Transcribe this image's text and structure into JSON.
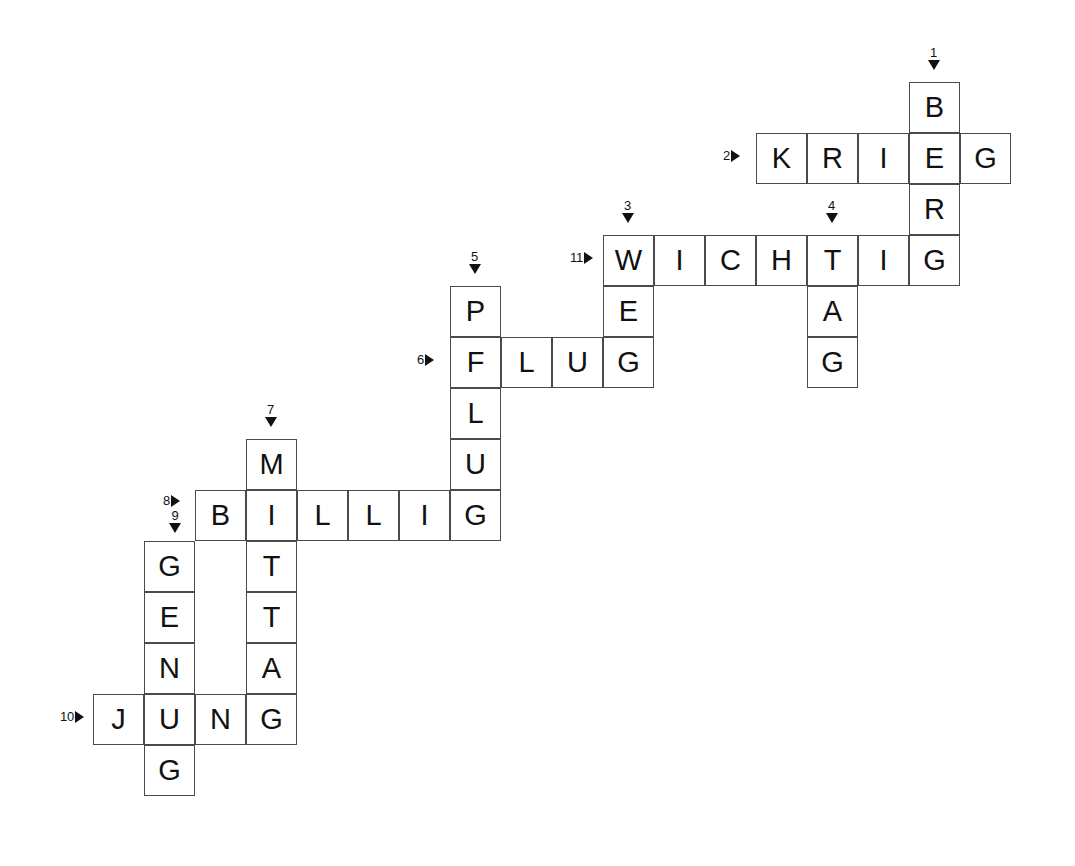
{
  "puzzle": {
    "type": "crossword",
    "language": "German",
    "title": "",
    "grid": {
      "origin_x": 93,
      "origin_y": 82,
      "cell_size": 51,
      "columns": 18,
      "rows": 14
    },
    "entries": [
      {
        "number": "1",
        "direction": "down",
        "answer": "BERG",
        "start_col": 16,
        "start_row": 0
      },
      {
        "number": "2",
        "direction": "across",
        "answer": "KRIEG",
        "start_col": 13,
        "start_row": 1
      },
      {
        "number": "3",
        "direction": "down",
        "answer": "WEG",
        "start_col": 10,
        "start_row": 3
      },
      {
        "number": "4",
        "direction": "down",
        "answer": "TAG",
        "start_col": 14,
        "start_row": 3
      },
      {
        "number": "5",
        "direction": "down",
        "answer": "PFLUG",
        "start_col": 7,
        "start_row": 4
      },
      {
        "number": "6",
        "direction": "across",
        "answer": "FLUG",
        "start_col": 7,
        "start_row": 5
      },
      {
        "number": "7",
        "direction": "down",
        "answer": "MITTAG",
        "start_col": 3,
        "start_row": 7
      },
      {
        "number": "8",
        "direction": "across",
        "answer": "BILLIG",
        "start_col": 2,
        "start_row": 8
      },
      {
        "number": "9",
        "direction": "down",
        "answer": "GENUG",
        "start_col": 1,
        "start_row": 9
      },
      {
        "number": "10",
        "direction": "across",
        "answer": "JUNG",
        "start_col": 0,
        "start_row": 12
      },
      {
        "number": "11",
        "direction": "across",
        "answer": "WICHTIG",
        "start_col": 10,
        "start_row": 3
      }
    ],
    "cells": [
      {
        "letter": "B",
        "col": 16,
        "row": 0
      },
      {
        "letter": "K",
        "col": 13,
        "row": 1
      },
      {
        "letter": "R",
        "col": 14,
        "row": 1
      },
      {
        "letter": "I",
        "col": 15,
        "row": 1
      },
      {
        "letter": "E",
        "col": 16,
        "row": 1
      },
      {
        "letter": "G",
        "col": 17,
        "row": 1
      },
      {
        "letter": "R",
        "col": 16,
        "row": 2
      },
      {
        "letter": "W",
        "col": 10,
        "row": 3
      },
      {
        "letter": "I",
        "col": 11,
        "row": 3
      },
      {
        "letter": "C",
        "col": 12,
        "row": 3
      },
      {
        "letter": "H",
        "col": 13,
        "row": 3
      },
      {
        "letter": "T",
        "col": 14,
        "row": 3
      },
      {
        "letter": "I",
        "col": 15,
        "row": 3
      },
      {
        "letter": "G",
        "col": 16,
        "row": 3
      },
      {
        "letter": "P",
        "col": 7,
        "row": 4
      },
      {
        "letter": "E",
        "col": 10,
        "row": 4
      },
      {
        "letter": "A",
        "col": 14,
        "row": 4
      },
      {
        "letter": "F",
        "col": 7,
        "row": 5
      },
      {
        "letter": "L",
        "col": 8,
        "row": 5
      },
      {
        "letter": "U",
        "col": 9,
        "row": 5
      },
      {
        "letter": "G",
        "col": 10,
        "row": 5
      },
      {
        "letter": "G",
        "col": 14,
        "row": 5
      },
      {
        "letter": "L",
        "col": 7,
        "row": 6
      },
      {
        "letter": "M",
        "col": 3,
        "row": 7
      },
      {
        "letter": "U",
        "col": 7,
        "row": 7
      },
      {
        "letter": "B",
        "col": 2,
        "row": 8
      },
      {
        "letter": "I",
        "col": 3,
        "row": 8
      },
      {
        "letter": "L",
        "col": 4,
        "row": 8
      },
      {
        "letter": "L",
        "col": 5,
        "row": 8
      },
      {
        "letter": "I",
        "col": 6,
        "row": 8
      },
      {
        "letter": "G",
        "col": 7,
        "row": 8
      },
      {
        "letter": "G",
        "col": 1,
        "row": 9
      },
      {
        "letter": "T",
        "col": 3,
        "row": 9
      },
      {
        "letter": "E",
        "col": 1,
        "row": 10
      },
      {
        "letter": "T",
        "col": 3,
        "row": 10
      },
      {
        "letter": "N",
        "col": 1,
        "row": 11
      },
      {
        "letter": "A",
        "col": 3,
        "row": 11
      },
      {
        "letter": "J",
        "col": 0,
        "row": 12
      },
      {
        "letter": "U",
        "col": 1,
        "row": 12
      },
      {
        "letter": "N",
        "col": 2,
        "row": 12
      },
      {
        "letter": "G",
        "col": 3,
        "row": 12
      },
      {
        "letter": "G",
        "col": 1,
        "row": 13
      }
    ],
    "markers": [
      {
        "number": "1",
        "direction": "down",
        "col": 16,
        "row": 0
      },
      {
        "number": "2",
        "direction": "across",
        "col": 13,
        "row": 1
      },
      {
        "number": "3",
        "direction": "down",
        "col": 10,
        "row": 3
      },
      {
        "number": "4",
        "direction": "down",
        "col": 14,
        "row": 3
      },
      {
        "number": "5",
        "direction": "down",
        "col": 7,
        "row": 4
      },
      {
        "number": "6",
        "direction": "across",
        "col": 7,
        "row": 5
      },
      {
        "number": "7",
        "direction": "down",
        "col": 3,
        "row": 7
      },
      {
        "number": "8",
        "direction": "across",
        "col": 2,
        "row": 8
      },
      {
        "number": "9",
        "direction": "down",
        "col": 1,
        "row": 9
      },
      {
        "number": "10",
        "direction": "across",
        "col": 0,
        "row": 12
      },
      {
        "number": "11",
        "direction": "across",
        "col": 10,
        "row": 3
      }
    ],
    "colors": {
      "cell_border": "#4a4a4a",
      "cell_background": "#ffffff",
      "letter": "#111111",
      "marker": "#111111",
      "page_background": "#ffffff"
    }
  }
}
